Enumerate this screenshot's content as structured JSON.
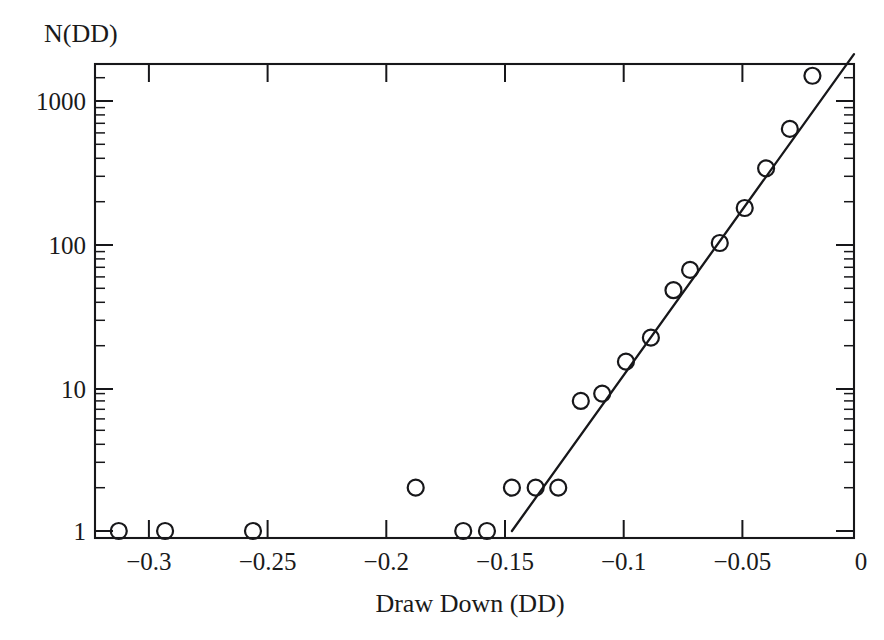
{
  "chart_data": {
    "type": "scatter",
    "title": "",
    "xlabel": "Draw Down (DD)",
    "ylabel": "N(DD)",
    "ylabel_position": "top-left",
    "grid": false,
    "legend": null,
    "xscale": "linear",
    "yscale": "log",
    "xlim": [
      -0.3195,
      0.0
    ],
    "ylim": [
      0.82,
      2100
    ],
    "xticks": [
      -0.3,
      -0.25,
      -0.2,
      -0.15,
      -0.1,
      -0.05,
      0
    ],
    "xticklabels": [
      "−0.3",
      "−0.25",
      "−0.2",
      "−0.15",
      "−0.1",
      "−0.05",
      "0"
    ],
    "yticks": [
      1,
      10,
      100,
      1000
    ],
    "yticklabels": [
      "1",
      "10",
      "100",
      "1000"
    ],
    "y_minor_ticks": [
      2,
      3,
      4,
      5,
      6,
      7,
      8,
      9,
      20,
      30,
      40,
      50,
      60,
      70,
      80,
      90,
      200,
      300,
      400,
      500,
      600,
      700,
      800,
      900,
      2000
    ],
    "marker": "open-circle",
    "marker_size": 9,
    "points": [
      {
        "x": -0.3095,
        "y": 1
      },
      {
        "x": -0.29,
        "y": 1
      },
      {
        "x": -0.253,
        "y": 1
      },
      {
        "x": -0.1845,
        "y": 2
      },
      {
        "x": -0.1645,
        "y": 1
      },
      {
        "x": -0.1545,
        "y": 1
      },
      {
        "x": -0.144,
        "y": 2
      },
      {
        "x": -0.134,
        "y": 2
      },
      {
        "x": -0.1245,
        "y": 2
      },
      {
        "x": -0.115,
        "y": 8
      },
      {
        "x": -0.106,
        "y": 9
      },
      {
        "x": -0.096,
        "y": 15
      },
      {
        "x": -0.0855,
        "y": 22
      },
      {
        "x": -0.076,
        "y": 47
      },
      {
        "x": -0.069,
        "y": 65
      },
      {
        "x": -0.0565,
        "y": 100
      },
      {
        "x": -0.046,
        "y": 175
      },
      {
        "x": -0.037,
        "y": 330
      },
      {
        "x": -0.027,
        "y": 620
      },
      {
        "x": -0.0175,
        "y": 1450
      }
    ],
    "fit_line": {
      "type": "exponential",
      "label": "",
      "x_start": -0.144,
      "y_start": 1.0,
      "x_end": 0.0,
      "y_end": 2050
    }
  },
  "axes": {
    "y_axis_title": "N(DD)",
    "x_axis_title": "Draw Down (DD)"
  }
}
